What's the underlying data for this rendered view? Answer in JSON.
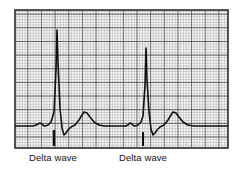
{
  "figure": {
    "kind": "ecg-rhythm-strip",
    "background_color": "#ffffff"
  },
  "grid": {
    "x": 15,
    "y": 10,
    "width": 213,
    "height": 138,
    "small_box_px": 2.73,
    "boxes_per_major": 5,
    "minor_color": "#9a9a9a",
    "major_color": "#3a3a3a",
    "border_color": "#2b2b2b"
  },
  "trace": {
    "color": "#101010",
    "stroke_width": 1.6,
    "baseline_y": 126,
    "beats": [
      {
        "name": "beat-1",
        "p_wave_peak_x": 40,
        "p_wave_peak_y": 123,
        "delta_onset_x": 45,
        "r_peak_x": 57,
        "r_peak_y": 30,
        "s_trough_x": 64,
        "s_trough_y": 135,
        "t_peak_x": 84,
        "t_peak_y": 112
      },
      {
        "name": "beat-2",
        "p_wave_peak_x": 130,
        "p_wave_peak_y": 123,
        "delta_onset_x": 135,
        "r_peak_x": 146,
        "r_peak_y": 48,
        "s_trough_x": 153,
        "s_trough_y": 135,
        "t_peak_x": 173,
        "t_peak_y": 112
      }
    ]
  },
  "markers": [
    {
      "name": "delta-tick-1",
      "x": 54,
      "y_top": 130,
      "y_bottom": 146,
      "color": "#0d0d0d",
      "width": 2.4
    },
    {
      "name": "delta-tick-2",
      "x": 143,
      "y_top": 132,
      "y_bottom": 146,
      "color": "#0d0d0d",
      "width": 2.0
    }
  ],
  "annotations": {
    "delta_wave_1": "Delta wave",
    "delta_wave_2": "Delta wave"
  },
  "chart_data": {
    "type": "line",
    "title": "",
    "xlabel": "",
    "ylabel": "",
    "legend": [],
    "annotations": [
      "Delta wave",
      "Delta wave"
    ],
    "grid": true,
    "series": [
      {
        "name": "ecg-lead-trace",
        "x": [
          15,
          22,
          28,
          33,
          36,
          38,
          40,
          42,
          44,
          45,
          48,
          51,
          54,
          56,
          57,
          58,
          60,
          62,
          64,
          66,
          68,
          71,
          75,
          79,
          82,
          84,
          87,
          90,
          94,
          99,
          104,
          110,
          116,
          122,
          126,
          128,
          130,
          132,
          134,
          135,
          138,
          141,
          143,
          145,
          146,
          147,
          149,
          151,
          153,
          155,
          157,
          160,
          164,
          168,
          171,
          173,
          176,
          179,
          183,
          188,
          194,
          201,
          210,
          219,
          228
        ],
        "y": [
          126,
          126,
          126,
          126,
          125,
          124,
          123,
          124,
          126,
          126,
          125,
          122,
          112,
          70,
          30,
          62,
          108,
          128,
          135,
          133,
          130,
          127,
          125,
          120,
          115,
          112,
          113,
          117,
          122,
          125,
          126,
          126,
          126,
          126,
          126,
          125,
          123,
          124,
          126,
          126,
          125,
          122,
          116,
          85,
          48,
          80,
          112,
          129,
          135,
          133,
          130,
          127,
          125,
          120,
          115,
          112,
          113,
          117,
          122,
          125,
          126,
          126,
          126,
          126,
          126
        ]
      }
    ]
  }
}
